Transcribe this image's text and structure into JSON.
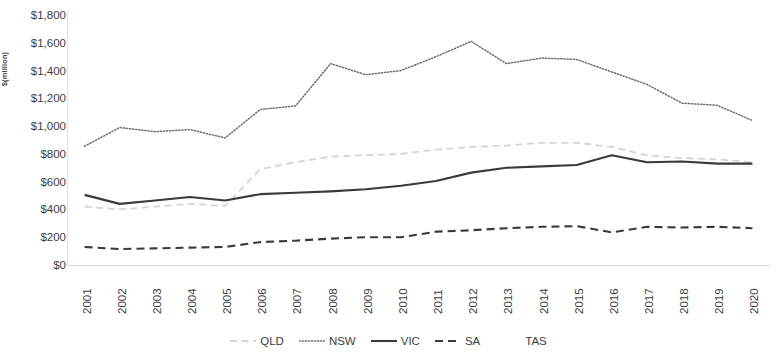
{
  "chart_data": {
    "type": "line",
    "title": "",
    "xlabel": "",
    "ylabel": "$(million)",
    "grid": false,
    "legend_position": "bottom",
    "ylim": [
      0,
      1800
    ],
    "ytick_step": 200,
    "ytick_labels": [
      "$1,800",
      "$1,600",
      "$1,400",
      "$1,200",
      "$1,000",
      "$800",
      "$600",
      "$400",
      "$200",
      "$0"
    ],
    "ytick_values": [
      1800,
      1600,
      1400,
      1200,
      1000,
      800,
      600,
      400,
      200,
      0
    ],
    "categories": [
      "2001",
      "2002",
      "2003",
      "2004",
      "2005",
      "2006",
      "2007",
      "2008",
      "2009",
      "2010",
      "2011",
      "2012",
      "2013",
      "2014",
      "2015",
      "2016",
      "2017",
      "2018",
      "2019",
      "2020"
    ],
    "series": [
      {
        "name": "QLD",
        "style": "dashed-light",
        "color": "#d3d3d3",
        "values": [
          420,
          400,
          420,
          440,
          425,
          690,
          740,
          780,
          790,
          800,
          830,
          850,
          860,
          880,
          880,
          850,
          790,
          770,
          760,
          740
        ]
      },
      {
        "name": "NSW",
        "style": "dotted",
        "color": "#707070",
        "values": [
          855,
          990,
          960,
          975,
          915,
          1120,
          1145,
          1450,
          1370,
          1400,
          1500,
          1610,
          1450,
          1490,
          1480,
          1390,
          1300,
          1165,
          1150,
          1040
        ]
      },
      {
        "name": "VIC",
        "style": "solid",
        "color": "#3a3a3a",
        "values": [
          505,
          440,
          465,
          490,
          465,
          510,
          520,
          530,
          545,
          570,
          605,
          665,
          700,
          710,
          720,
          790,
          740,
          745,
          730,
          730
        ]
      },
      {
        "name": "SA",
        "style": "dashed-dark",
        "color": "#3a3a3a",
        "values": [
          130,
          115,
          120,
          125,
          130,
          165,
          175,
          190,
          200,
          200,
          240,
          250,
          265,
          275,
          280,
          235,
          275,
          270,
          275,
          265
        ]
      },
      {
        "name": "TAS",
        "style": "none",
        "color": "#ffffff",
        "values": [
          0,
          0,
          0,
          0,
          0,
          0,
          0,
          0,
          0,
          0,
          0,
          0,
          0,
          0,
          0,
          0,
          0,
          0,
          0,
          0
        ]
      }
    ]
  },
  "legend": {
    "items": [
      {
        "label": "QLD",
        "swatch": "dashed-light-swatch"
      },
      {
        "label": "NSW",
        "swatch": "dotted-swatch"
      },
      {
        "label": "VIC",
        "swatch": "solid-swatch"
      },
      {
        "label": "SA",
        "swatch": "dashed-dark-swatch"
      },
      {
        "label": "TAS",
        "swatch": "blank-swatch"
      }
    ]
  }
}
